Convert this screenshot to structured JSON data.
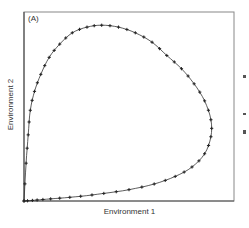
{
  "chart_data": {
    "type": "line",
    "title": "",
    "panel_label": "(A)",
    "xlabel": "Environment 1",
    "ylabel": "Environment 2",
    "xlim": [
      0,
      1
    ],
    "ylim": [
      0,
      1
    ],
    "grid": false,
    "legend": null,
    "ticks": "none",
    "series": [
      {
        "name": "trajectory",
        "marker": "+",
        "closed": true,
        "x": [
          0.0,
          0.01,
          0.02,
          0.03,
          0.05,
          0.08,
          0.12,
          0.17,
          0.23,
          0.3,
          0.37,
          0.45,
          0.53,
          0.61,
          0.68,
          0.75,
          0.81,
          0.86,
          0.89,
          0.89,
          0.86,
          0.8,
          0.72,
          0.62,
          0.5,
          0.38,
          0.27,
          0.17,
          0.09,
          0.04,
          0.0
        ],
        "y": [
          0.0,
          0.2,
          0.35,
          0.48,
          0.58,
          0.67,
          0.76,
          0.83,
          0.89,
          0.92,
          0.93,
          0.92,
          0.89,
          0.84,
          0.77,
          0.7,
          0.62,
          0.53,
          0.43,
          0.34,
          0.25,
          0.18,
          0.13,
          0.09,
          0.06,
          0.04,
          0.025,
          0.015,
          0.008,
          0.003,
          0.0
        ]
      }
    ]
  }
}
